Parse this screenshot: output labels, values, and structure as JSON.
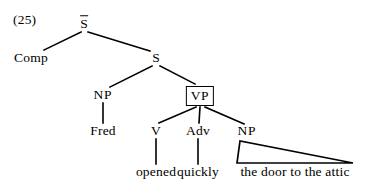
{
  "figure": {
    "example_number": "(25)",
    "kind": "syntax-tree",
    "sentence": "Comp Fred opened quickly the door to the attic",
    "ink_color": "#000000",
    "background_color": "#ffffff"
  },
  "nodes": {
    "sbar": {
      "label": "S",
      "has_overbar": true,
      "x": 84,
      "y": 23
    },
    "comp": {
      "label": "Comp",
      "x": 31,
      "y": 58
    },
    "s": {
      "label": "S",
      "x": 156,
      "y": 58
    },
    "np_subject": {
      "label": "NP",
      "x": 103,
      "y": 95
    },
    "vp": {
      "label": "VP",
      "boxed": true,
      "x": 200,
      "y": 95
    },
    "v": {
      "label": "V",
      "x": 156,
      "y": 131
    },
    "adv": {
      "label": "Adv",
      "x": 198,
      "y": 131
    },
    "np_object": {
      "label": "NP",
      "x": 247,
      "y": 131
    }
  },
  "terminals": {
    "fred": {
      "text": "Fred",
      "x": 103,
      "y": 131
    },
    "opened": {
      "text": "opened",
      "x": 156,
      "y": 172
    },
    "quickly": {
      "text": "quickly",
      "x": 198,
      "y": 172
    },
    "object_phrase": {
      "text": "the door to the attic",
      "x": 295,
      "y": 172
    }
  },
  "triangle": {
    "description": "abbreviated-constituent-triangle",
    "apex_x": 240,
    "apex_y": 141,
    "left_base_x": 237,
    "right_base_x": 353,
    "base_y": 163
  }
}
